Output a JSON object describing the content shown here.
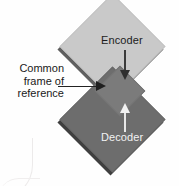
{
  "figure": {
    "background_color": "#fefefe"
  },
  "shapes": {
    "encoder": {
      "label": "Encoder",
      "fill": "#c9c9c9",
      "text_color": "#1c1c1c",
      "shadow": "#5f5f5f"
    },
    "decoder": {
      "label": "Decoder",
      "fill": "#6d6d6d",
      "text_color": "#f2f2f2",
      "shadow": "#3f3f3f"
    },
    "overlap": {
      "fill": "#7b7b7b"
    }
  },
  "arrows": {
    "encoder_to_common": {
      "direction": "down",
      "color": "#2e2e2e"
    },
    "decoder_to_common": {
      "direction": "up",
      "color": "#f2f2f2"
    },
    "callout_pointer": {
      "direction": "right",
      "color": "#1f1f1f"
    }
  },
  "callout": {
    "lines": [
      "Common",
      "frame of",
      "reference"
    ],
    "line1": "Common",
    "line2": "frame of",
    "line3": "reference"
  }
}
